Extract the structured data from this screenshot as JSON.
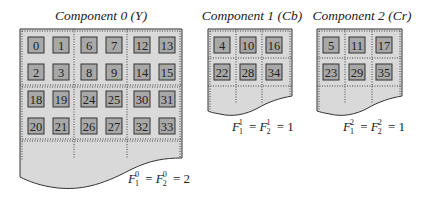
{
  "colors": {
    "paper_fill": "#d9d9d9",
    "cell_fill": "#a8a8a8",
    "outline": "#333333",
    "dotted": "#444444",
    "text": "#222222"
  },
  "components": [
    {
      "title": "Component 0 (Y)",
      "cells": [
        [
          "0",
          "1",
          "6",
          "7",
          "12",
          "13"
        ],
        [
          "2",
          "3",
          "8",
          "9",
          "14",
          "15"
        ],
        [
          "18",
          "19",
          "24",
          "25",
          "30",
          "31"
        ],
        [
          "20",
          "21",
          "26",
          "27",
          "32",
          "33"
        ]
      ],
      "equation": {
        "F1": "F",
        "sub1": "1",
        "sup": "0",
        "F2": "F",
        "sub2": "2",
        "value": "2"
      }
    },
    {
      "title": "Component 1 (Cb)",
      "cells": [
        [
          "4",
          "10",
          "16"
        ],
        [
          "22",
          "28",
          "34"
        ]
      ],
      "equation": {
        "F1": "F",
        "sub1": "1",
        "sup": "1",
        "F2": "F",
        "sub2": "2",
        "value": "1"
      }
    },
    {
      "title": "Component 2 (Cr)",
      "cells": [
        [
          "5",
          "11",
          "17"
        ],
        [
          "23",
          "29",
          "35"
        ]
      ],
      "equation": {
        "F1": "F",
        "sub1": "1",
        "sup": "2",
        "F2": "F",
        "sub2": "2",
        "value": "1"
      }
    }
  ]
}
